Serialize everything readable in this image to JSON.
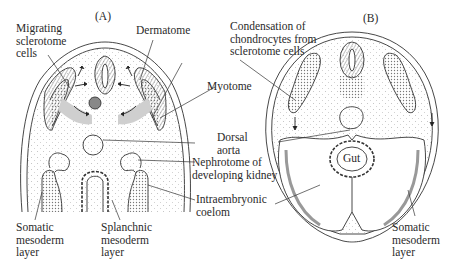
{
  "panels": [
    {
      "id": "A",
      "label": "(A)"
    },
    {
      "id": "B",
      "label": "(B)"
    }
  ],
  "labels": {
    "migrating_sclerotome": "Migrating\nsclerotome\ncells",
    "dermatome": "Dermatome",
    "condensation": "Condensation of\nchondrocytes from\nsclerotome cells",
    "myotome": "Myotome",
    "dorsal_aorta": "Dorsal\naorta",
    "nephrotome": "Nephrotome of\ndeveloping kidney",
    "intraembryonic_coelom": "Intraembryonic\ncoelom",
    "somatic_a": "Somatic\nmesoderm\nlayer",
    "splanchnic_a": "Splanchnic\nmesoderm\nlayer",
    "gut": "Gut",
    "somatic_b": "Somatic\nmesoderm\nlayer"
  },
  "colors": {
    "line": "#333333",
    "stipple": "#b5b5b5",
    "dense": "#8a8a8a"
  }
}
